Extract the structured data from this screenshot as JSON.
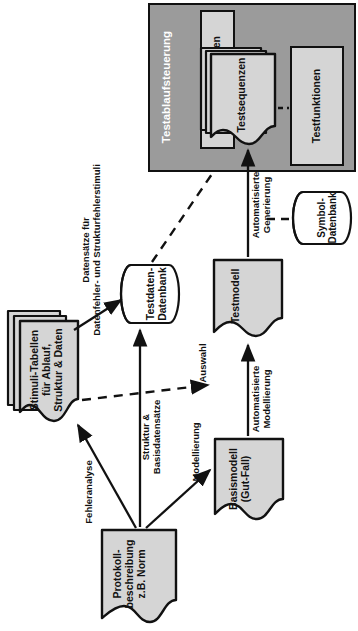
{
  "diagram": {
    "orientation": "rotated-90-ccw",
    "colors": {
      "container_fill": "#9b9b9b",
      "node_fill": "#d5d5d5",
      "db_fill": "#ffffff",
      "stroke": "#111111",
      "container_label": "#ffffff"
    }
  },
  "nodes": {
    "testablaufsteuerung": {
      "label": "Testablaufsteuerung",
      "type": "container"
    },
    "laufzeitvariablen": {
      "label": "Laufzeitvariablen",
      "type": "box"
    },
    "testsequenzen": {
      "label": "Testsequenzen",
      "type": "document-stack",
      "copies": 3
    },
    "testfunktionen": {
      "label": "Testfunktionen",
      "type": "box"
    },
    "symbol_datenbank": {
      "label": "Symbol-\nDatenbank",
      "type": "database"
    },
    "testdaten_datenbank": {
      "label": "Testdaten-\nDatenbank",
      "type": "database"
    },
    "testmodell": {
      "label": "Testmodell",
      "type": "document"
    },
    "basismodell": {
      "label": "Basismodell\n(Gut-Fall)",
      "type": "document"
    },
    "stimuli_tabellen": {
      "label": "Stimuli-Tabellen\nfür Ablauf,\nStruktur & Daten",
      "type": "document-stack",
      "copies": 3
    },
    "protokollbeschreibung": {
      "label": "Protokoll-\nbeschreibung\nz.B. Norm",
      "type": "document"
    }
  },
  "edges": [
    {
      "id": "e1",
      "label": "Datensätze für\nDatenfehler- und Strukturfehlerstimuli",
      "from": "stimuli_tabellen",
      "to": "testdaten_datenbank",
      "style": "solid"
    },
    {
      "id": "e2",
      "label": "Struktur &\nBasisdatensätze",
      "from": "protokollbeschreibung",
      "to": "testdaten_datenbank",
      "style": "solid"
    },
    {
      "id": "e3",
      "label": "Fehleranalyse",
      "from": "protokollbeschreibung",
      "to": "stimuli_tabellen",
      "style": "solid"
    },
    {
      "id": "e4",
      "label": "Modellierung",
      "from": "protokollbeschreibung",
      "to": "basismodell",
      "style": "solid"
    },
    {
      "id": "e5",
      "label": "Automatisierte\nModellierung",
      "from": "basismodell",
      "to": "testmodell",
      "style": "solid"
    },
    {
      "id": "e6",
      "label": "Automatisierte\nGenerierung",
      "from": "testmodell",
      "to": "testsequenzen",
      "style": "solid"
    },
    {
      "id": "e7",
      "label": "Auswahl",
      "from": "stimuli_tabellen",
      "to": "testmodell",
      "style": "dashed"
    },
    {
      "id": "e8",
      "label": "",
      "from": "testdaten_datenbank",
      "to": "testablaufsteuerung",
      "style": "dashed"
    },
    {
      "id": "e9",
      "label": "",
      "from": "symbol_datenbank",
      "to": "e6",
      "style": "dashed"
    },
    {
      "id": "e10",
      "label": "",
      "from": "testsequenzen",
      "to": "testfunktionen",
      "style": "dashed"
    }
  ]
}
